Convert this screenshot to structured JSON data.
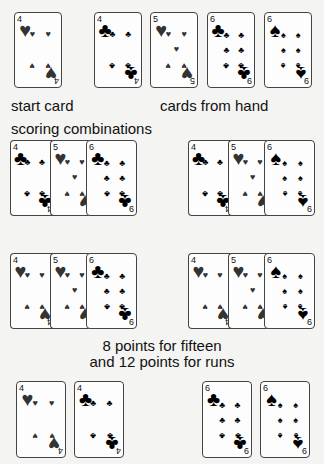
{
  "labels": {
    "start_card": "start card",
    "cards_from_hand": "cards from hand",
    "scoring_combinations": "scoring combinations",
    "caption_line1": "8 points for fifteen",
    "caption_line2": "and 12 points for runs"
  },
  "suit_glyphs": {
    "hearts": "♥",
    "clubs": "♣",
    "spades": "♠"
  },
  "colors": {
    "background": "#f4f4f2",
    "card_face": "#fdfdfd",
    "card_border": "#444444",
    "ink": "#111111"
  },
  "start_card": {
    "rank": "4",
    "suit": "hearts"
  },
  "hand": [
    {
      "rank": "4",
      "suit": "clubs"
    },
    {
      "rank": "5",
      "suit": "hearts"
    },
    {
      "rank": "6",
      "suit": "clubs"
    },
    {
      "rank": "6",
      "suit": "spades"
    }
  ],
  "scoring_rows": [
    [
      [
        {
          "rank": "4",
          "suit": "clubs"
        },
        {
          "rank": "5",
          "suit": "hearts"
        },
        {
          "rank": "6",
          "suit": "clubs"
        }
      ],
      [
        {
          "rank": "4",
          "suit": "clubs"
        },
        {
          "rank": "5",
          "suit": "hearts"
        },
        {
          "rank": "6",
          "suit": "spades"
        }
      ]
    ],
    [
      [
        {
          "rank": "4",
          "suit": "hearts"
        },
        {
          "rank": "5",
          "suit": "hearts"
        },
        {
          "rank": "6",
          "suit": "clubs"
        }
      ],
      [
        {
          "rank": "4",
          "suit": "hearts"
        },
        {
          "rank": "5",
          "suit": "hearts"
        },
        {
          "rank": "6",
          "suit": "spades"
        }
      ]
    ]
  ],
  "bottom_pairs": [
    [
      {
        "rank": "4",
        "suit": "hearts"
      },
      {
        "rank": "4",
        "suit": "clubs"
      }
    ],
    [
      {
        "rank": "6",
        "suit": "clubs"
      },
      {
        "rank": "6",
        "suit": "spades"
      }
    ]
  ]
}
